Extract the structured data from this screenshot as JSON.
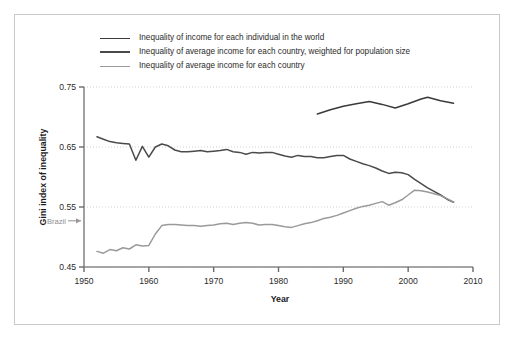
{
  "chart_data": {
    "type": "line",
    "title": "",
    "xlabel": "Year",
    "ylabel": "Gini index of inequality",
    "xlim": [
      1950,
      2010
    ],
    "ylim": [
      0.45,
      0.75
    ],
    "xticks": [
      1950,
      1960,
      1970,
      1980,
      1990,
      2000,
      2010
    ],
    "xtick_labels": [
      "1950",
      "1960",
      "1970",
      "1980",
      "1990",
      "2000",
      "2010"
    ],
    "yticks": [
      0.45,
      0.55,
      0.65,
      0.75
    ],
    "ytick_labels": [
      "0.45",
      "0.55",
      "0.65",
      "0.75"
    ],
    "grid": "horizontal-dotted",
    "legend_position": "top-left-above-axes",
    "annotations": [
      {
        "text": "Brazil",
        "arrow": "→",
        "x": 1950,
        "y": 0.527,
        "color": "#9a9a9a"
      }
    ],
    "series": [
      {
        "name": "Inequality of income for each individual in the world",
        "color": "#3a3a3a",
        "width": 1.5,
        "x": [
          1986,
          1988,
          1990,
          1992,
          1994,
          1996,
          1998,
          2000,
          2002,
          2003,
          2005,
          2007
        ],
        "y": [
          0.705,
          0.712,
          0.718,
          0.722,
          0.726,
          0.721,
          0.715,
          0.722,
          0.73,
          0.733,
          0.727,
          0.723
        ]
      },
      {
        "name": "Inequality of average income for each country, weighted for population size",
        "color": "#4a4a4a",
        "width": 1.5,
        "x": [
          1952,
          1953,
          1954,
          1955,
          1956,
          1957,
          1958,
          1959,
          1960,
          1961,
          1962,
          1963,
          1964,
          1965,
          1966,
          1967,
          1968,
          1969,
          1970,
          1971,
          1972,
          1973,
          1974,
          1975,
          1976,
          1977,
          1978,
          1979,
          1980,
          1981,
          1982,
          1983,
          1984,
          1985,
          1986,
          1987,
          1988,
          1989,
          1990,
          1991,
          1992,
          1993,
          1994,
          1995,
          1996,
          1997,
          1998,
          1999,
          2000,
          2001,
          2002,
          2003,
          2004,
          2005,
          2006,
          2007
        ],
        "y": [
          0.667,
          0.663,
          0.659,
          0.657,
          0.656,
          0.655,
          0.628,
          0.651,
          0.633,
          0.65,
          0.655,
          0.652,
          0.645,
          0.642,
          0.642,
          0.643,
          0.644,
          0.642,
          0.643,
          0.644,
          0.646,
          0.642,
          0.641,
          0.638,
          0.641,
          0.64,
          0.641,
          0.641,
          0.638,
          0.635,
          0.633,
          0.636,
          0.634,
          0.634,
          0.632,
          0.632,
          0.634,
          0.636,
          0.636,
          0.63,
          0.626,
          0.622,
          0.619,
          0.615,
          0.61,
          0.606,
          0.608,
          0.607,
          0.604,
          0.596,
          0.589,
          0.582,
          0.576,
          0.57,
          0.563,
          0.558
        ]
      },
      {
        "name": "Inequality of average income for each country",
        "color": "#9a9a9a",
        "width": 1.5,
        "x": [
          1952,
          1953,
          1954,
          1955,
          1956,
          1957,
          1958,
          1959,
          1960,
          1961,
          1962,
          1963,
          1964,
          1965,
          1966,
          1967,
          1968,
          1969,
          1970,
          1971,
          1972,
          1973,
          1974,
          1975,
          1976,
          1977,
          1978,
          1979,
          1980,
          1981,
          1982,
          1983,
          1984,
          1985,
          1986,
          1987,
          1988,
          1989,
          1990,
          1991,
          1992,
          1993,
          1994,
          1995,
          1996,
          1997,
          1998,
          1999,
          2000,
          2001,
          2002,
          2003,
          2004,
          2005,
          2006,
          2007
        ],
        "y": [
          0.476,
          0.473,
          0.479,
          0.477,
          0.482,
          0.48,
          0.487,
          0.485,
          0.486,
          0.505,
          0.519,
          0.521,
          0.521,
          0.52,
          0.519,
          0.519,
          0.518,
          0.519,
          0.52,
          0.522,
          0.523,
          0.521,
          0.523,
          0.524,
          0.523,
          0.52,
          0.521,
          0.521,
          0.519,
          0.517,
          0.516,
          0.519,
          0.522,
          0.524,
          0.527,
          0.531,
          0.533,
          0.536,
          0.54,
          0.544,
          0.548,
          0.551,
          0.553,
          0.556,
          0.559,
          0.553,
          0.557,
          0.562,
          0.57,
          0.578,
          0.577,
          0.575,
          0.572,
          0.569,
          0.564,
          0.558
        ]
      }
    ]
  },
  "legend": {
    "items": [
      {
        "label": "Inequality of income for each individual in the world",
        "color": "#3a3a3a"
      },
      {
        "label": "Inequality of average income for each country, weighted for population size",
        "color": "#4a4a4a"
      },
      {
        "label": "Inequality of average income for each country",
        "color": "#9a9a9a"
      }
    ]
  },
  "axes": {
    "x_title": "Year",
    "y_title": "Gini index of inequality"
  },
  "annotation": {
    "brazil_label": "Brazil",
    "brazil_arrow": "→"
  }
}
